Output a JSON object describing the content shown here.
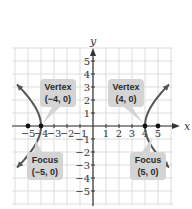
{
  "chart_data": {
    "type": "line",
    "title": "",
    "equation": "x^2/16 - y^2/9 = 1",
    "xlabel": "x",
    "ylabel": "y",
    "xlim": [
      -6,
      6
    ],
    "ylim": [
      -6,
      6
    ],
    "grid": true,
    "x_ticks": [
      "-5",
      "-4",
      "-3",
      "-2",
      "-1",
      "1",
      "2",
      "3",
      "4",
      "5"
    ],
    "y_ticks": [
      "5",
      "4",
      "3",
      "2",
      "1",
      "-1",
      "-2",
      "-3",
      "-4",
      "-5"
    ],
    "series": [
      {
        "name": "left-branch",
        "a": 4,
        "b": 3,
        "side": -1,
        "y_range": [
          -3.2,
          3.2
        ]
      },
      {
        "name": "right-branch",
        "a": 4,
        "b": 3,
        "side": 1,
        "y_range": [
          -3.2,
          3.2
        ]
      }
    ],
    "points": [
      {
        "label": "Focus (-5, 0)",
        "x": -5,
        "y": 0
      },
      {
        "label": "Vertex (-4, 0)",
        "x": -4,
        "y": 0
      },
      {
        "label": "Vertex (4, 0)",
        "x": 4,
        "y": 0
      },
      {
        "label": "Focus (5, 0)",
        "x": 5,
        "y": 0
      }
    ],
    "annotations": [
      {
        "id": "vertex-left",
        "line1": "Vertex",
        "line2": "(−4, 0)",
        "target": [
          -4,
          0
        ]
      },
      {
        "id": "vertex-right",
        "line1": "Vertex",
        "line2": "(4, 0)",
        "target": [
          4,
          0
        ]
      },
      {
        "id": "focus-left",
        "line1": "Focus",
        "line2": "(−5, 0)",
        "target": [
          -5,
          0
        ]
      },
      {
        "id": "focus-right",
        "line1": "Focus",
        "line2": "(5, 0)",
        "target": [
          5,
          0
        ]
      }
    ],
    "colors": {
      "curve": "#555555",
      "grid": "#dddddd",
      "axis": "#333333",
      "callout_bg": "#d4d4d4",
      "point": "#111111"
    }
  }
}
